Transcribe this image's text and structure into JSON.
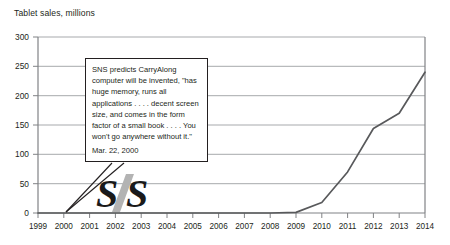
{
  "chart_data": {
    "type": "line",
    "title": "Tablet sales, millions",
    "xlabel": "",
    "ylabel": "",
    "ylim": [
      0,
      300
    ],
    "yticks": [
      0,
      50,
      100,
      150,
      200,
      250,
      300
    ],
    "grid": true,
    "legend": "none",
    "categories": [
      1999,
      2000,
      2001,
      2002,
      2003,
      2004,
      2005,
      2006,
      2007,
      2008,
      2009,
      2010,
      2011,
      2012,
      2013,
      2014
    ],
    "x": [
      "1999",
      "2000",
      "2001",
      "2002",
      "2003",
      "2004",
      "2005",
      "2006",
      "2007",
      "2008",
      "2009",
      "2010",
      "2011",
      "2012",
      "2013",
      "2014"
    ],
    "values": [
      0,
      0,
      0,
      0,
      0,
      0,
      0,
      0,
      0,
      0,
      1,
      18,
      70,
      144,
      170,
      240
    ],
    "series": [
      {
        "name": "Tablet sales",
        "values": [
          0,
          0,
          0,
          0,
          0,
          0,
          0,
          0,
          0,
          0,
          1,
          18,
          70,
          144,
          170,
          240
        ],
        "color": "#58595b"
      }
    ],
    "annotations": [
      {
        "name": "sns-prediction",
        "text": "SNS predicts CarryAlong computer will be invented, \"has huge memory, runs all applications . . . . decent screen size, and comes in the form factor of a small book . . . . You won't go anywhere without it.\"",
        "date": "Mar. 22, 2000",
        "points_to_year": "2000",
        "points_to_value": 0
      }
    ]
  },
  "chart": {
    "title": "Tablet sales, millions",
    "ytick_labels": [
      "300",
      "250",
      "200",
      "150",
      "100",
      "50",
      "0"
    ],
    "xtick_labels": [
      "1999",
      "2000",
      "2001",
      "2002",
      "2003",
      "2004",
      "2005",
      "2006",
      "2007",
      "2008",
      "2009",
      "2010",
      "2011",
      "2012",
      "2013",
      "2014"
    ]
  },
  "callout": {
    "body": "SNS predicts CarryAlong computer will be invented, \"has huge memory, runs all applications . . . . decent screen size, and comes in the form factor of a small book . . . . You won't go anywhere without it.\"",
    "date": "Mar. 22, 2000"
  },
  "logo": {
    "name": "sns-logo",
    "text": "SNS",
    "dark_color": "#1a1a1a",
    "accent_color": "#b3b3b3"
  },
  "colors": {
    "line": "#58595b",
    "grid": "#a7a9ac",
    "axis": "#808285",
    "text": "#231f20"
  }
}
